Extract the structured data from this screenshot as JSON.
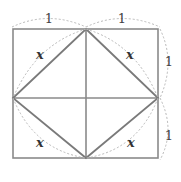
{
  "diagram": {
    "labels": {
      "top_left_segment": "1",
      "top_right_segment": "1",
      "right_upper_segment": "1",
      "right_lower_segment": "1",
      "inner_side_top_left": "x",
      "inner_side_top_right": "x",
      "inner_side_bottom_left": "x",
      "inner_side_bottom_right": "x"
    },
    "colors": {
      "outline": "#8a8a8a",
      "inner_square": "#7a7a7a",
      "dotted_arcs": "#b8b8b8"
    }
  }
}
